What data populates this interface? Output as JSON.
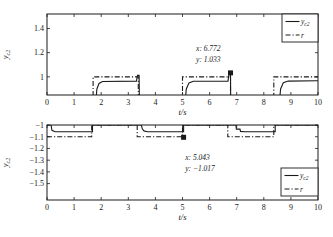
{
  "figure": {
    "background": "#ffffff",
    "line_color": "#1a1a1a"
  },
  "chart_data": [
    {
      "id": "top",
      "type": "line",
      "title": "",
      "xlabel": "t/s",
      "ylabel": {
        "base": "y",
        "sub": "c2"
      },
      "xlim": [
        0,
        10
      ],
      "ylim": [
        0.85,
        1.52
      ],
      "xticks": [
        0,
        1,
        2,
        3,
        4,
        5,
        6,
        7,
        8,
        9,
        10
      ],
      "xtick_labels": [
        "0",
        "1",
        "2",
        "3",
        "4",
        "5",
        "6",
        "7",
        "8",
        "9",
        "10"
      ],
      "yticks": [
        1,
        1.2,
        1.4
      ],
      "ytick_labels": [
        "1",
        "1.2",
        "1.4"
      ],
      "grid": false,
      "legend": {
        "position": "top-right",
        "entries": [
          {
            "label": {
              "base": "y",
              "sub": "c2"
            },
            "style": "solid"
          },
          {
            "label": {
              "base": "r",
              "sub": ""
            },
            "style": "dashdot"
          }
        ]
      },
      "annotation": {
        "lines": [
          "x: 6.772",
          "y: 1.033"
        ],
        "marker_at": [
          6.772,
          1.033
        ],
        "text_at": [
          5.5,
          1.215
        ]
      },
      "series": [
        {
          "name": "r",
          "style": "dashdot",
          "points": [
            [
              0,
              0.8
            ],
            [
              1.7,
              0.8
            ],
            [
              1.7,
              1.0
            ],
            [
              3.37,
              1.0
            ],
            [
              3.37,
              0.8
            ],
            [
              5.0,
              0.8
            ],
            [
              5.0,
              1.0
            ],
            [
              6.77,
              1.0
            ],
            [
              6.77,
              0.8
            ],
            [
              8.37,
              0.8
            ],
            [
              8.37,
              1.0
            ],
            [
              10,
              1.0
            ]
          ]
        },
        {
          "name": "y_c2",
          "style": "solid",
          "points": [
            [
              0,
              0.8
            ],
            [
              1.8,
              0.8
            ],
            [
              1.84,
              0.9
            ],
            [
              1.92,
              0.945
            ],
            [
              2.05,
              0.962
            ],
            [
              3.3,
              0.965
            ],
            [
              3.34,
              1.012
            ],
            [
              3.4,
              1.012
            ],
            [
              3.41,
              0.8
            ],
            [
              5.1,
              0.8
            ],
            [
              5.14,
              0.9
            ],
            [
              5.24,
              0.95
            ],
            [
              5.4,
              0.963
            ],
            [
              6.68,
              0.965
            ],
            [
              6.72,
              1.033
            ],
            [
              6.77,
              1.033
            ],
            [
              6.78,
              0.8
            ],
            [
              8.58,
              0.8
            ],
            [
              8.62,
              0.9
            ],
            [
              8.72,
              0.952
            ],
            [
              8.9,
              0.965
            ],
            [
              10,
              0.968
            ]
          ]
        }
      ]
    },
    {
      "id": "bottom",
      "type": "line",
      "title": "",
      "xlabel": "t/s",
      "ylabel": {
        "base": "y",
        "sub": "c2"
      },
      "xlim": [
        0,
        10
      ],
      "ylim": [
        -1.64,
        -1.0
      ],
      "xticks": [
        0,
        1,
        2,
        3,
        4,
        5,
        6,
        7,
        8,
        9,
        10
      ],
      "xtick_labels": [
        "0",
        "1",
        "2",
        "3",
        "4",
        "5",
        "6",
        "7",
        "8",
        "9",
        "10"
      ],
      "yticks": [
        -1.0,
        -1.1,
        -1.2,
        -1.3,
        -1.4,
        -1.5
      ],
      "ytick_labels": [
        "−1",
        "−1.1",
        "−1.2",
        "−1.3",
        "−1.4",
        "−1.5"
      ],
      "grid": false,
      "legend": {
        "position": "bottom-right",
        "entries": [
          {
            "label": {
              "base": "y",
              "sub": "c2"
            },
            "style": "solid"
          },
          {
            "label": {
              "base": "r",
              "sub": ""
            },
            "style": "dashdot"
          }
        ]
      },
      "annotation": {
        "lines": [
          "x: 5.043",
          "y: −1.017"
        ],
        "marker_at": [
          5.04,
          -1.105
        ],
        "text_at": [
          5.1,
          -1.3
        ]
      },
      "series": [
        {
          "name": "r",
          "style": "dashdot",
          "points": [
            [
              0,
              -1.1
            ],
            [
              1.65,
              -1.1
            ],
            [
              1.65,
              -1.0
            ],
            [
              3.33,
              -1.0
            ],
            [
              3.33,
              -1.1
            ],
            [
              5.0,
              -1.1
            ],
            [
              5.0,
              -1.0
            ],
            [
              6.67,
              -1.0
            ],
            [
              6.67,
              -1.1
            ],
            [
              8.37,
              -1.1
            ],
            [
              8.37,
              -1.0
            ],
            [
              10,
              -1.0
            ]
          ]
        },
        {
          "name": "y_c2",
          "style": "solid",
          "points": [
            [
              0,
              -1.0
            ],
            [
              0.15,
              -1.0
            ],
            [
              0.18,
              -1.045
            ],
            [
              0.3,
              -1.058
            ],
            [
              1.68,
              -1.058
            ],
            [
              1.68,
              -1.0
            ],
            [
              3.48,
              -1.0
            ],
            [
              3.52,
              -1.035
            ],
            [
              3.58,
              -1.05
            ],
            [
              3.7,
              -1.058
            ],
            [
              5.04,
              -1.058
            ],
            [
              5.04,
              -1.0
            ],
            [
              6.97,
              -1.0
            ],
            [
              6.99,
              -1.035
            ],
            [
              7.12,
              -1.035
            ],
            [
              7.14,
              -1.055
            ],
            [
              7.3,
              -1.058
            ],
            [
              8.42,
              -1.058
            ],
            [
              8.42,
              -1.0
            ],
            [
              10,
              -1.0
            ]
          ]
        }
      ]
    }
  ]
}
